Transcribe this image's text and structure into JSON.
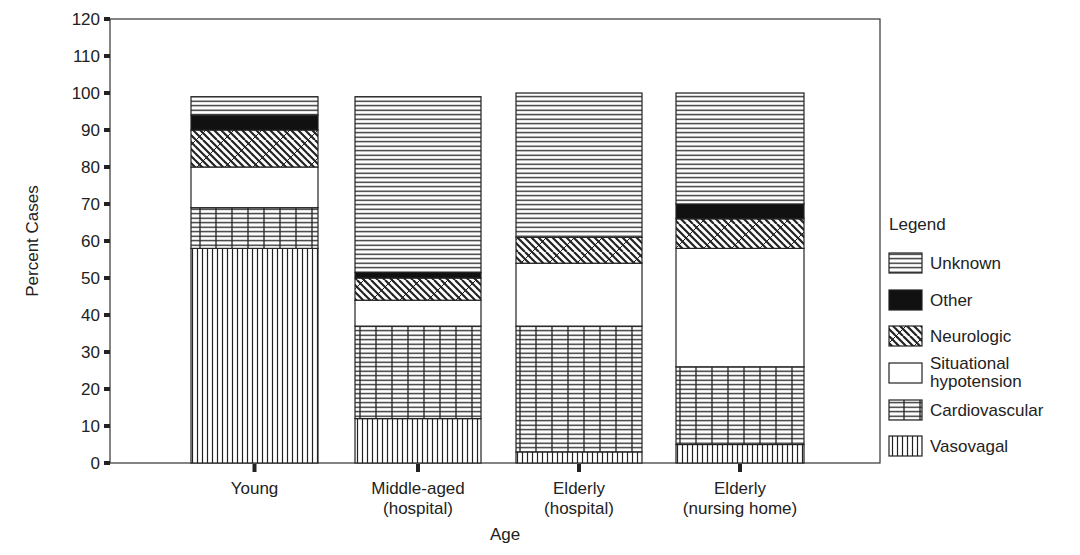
{
  "chart_data": {
    "type": "bar",
    "stacked": true,
    "title": "",
    "xlabel": "Age",
    "ylabel": "Percent Cases",
    "ylim": [
      0,
      120
    ],
    "yticks": [
      0,
      10,
      20,
      30,
      40,
      50,
      60,
      70,
      80,
      90,
      100,
      110,
      120
    ],
    "grid": false,
    "legend_position": "right",
    "legend_title": "Legend",
    "categories": [
      [
        "Young"
      ],
      [
        "Middle-aged",
        "(hospital)"
      ],
      [
        "Elderly",
        "(hospital)"
      ],
      [
        "Elderly",
        "(nursing home)"
      ]
    ],
    "series": [
      {
        "name": "Vasovagal",
        "pattern": "vertical-lines",
        "values": [
          58,
          12,
          3,
          5
        ]
      },
      {
        "name": "Cardiovascular",
        "pattern": "grid",
        "values": [
          11,
          25,
          34,
          21
        ]
      },
      {
        "name": "Situational hypotension",
        "pattern": "blank",
        "values": [
          11,
          7,
          17,
          32
        ]
      },
      {
        "name": "Neurologic",
        "pattern": "crosshatch-diagonal",
        "values": [
          10,
          6,
          7,
          8
        ]
      },
      {
        "name": "Other",
        "pattern": "solid-black",
        "values": [
          4,
          1.5,
          0,
          4
        ]
      },
      {
        "name": "Unknown",
        "pattern": "horizontal-lines",
        "values": [
          5,
          47.5,
          39,
          30
        ]
      }
    ],
    "legend_order": [
      "Unknown",
      "Other",
      "Neurologic",
      "Situational hypotension",
      "Cardiovascular",
      "Vasovagal"
    ],
    "legend_labels": [
      [
        "Unknown"
      ],
      [
        "Other"
      ],
      [
        "Neurologic"
      ],
      [
        "Situational",
        "hypotension"
      ],
      [
        "Cardiovascular"
      ],
      [
        "Vasovagal"
      ]
    ]
  },
  "colors": {
    "ink": "#222222",
    "background": "#ffffff"
  }
}
